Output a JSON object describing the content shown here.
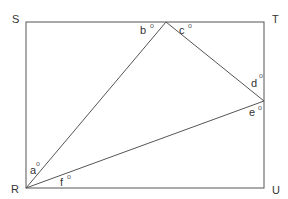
{
  "diagram": {
    "title": "",
    "colors": {
      "line": "#555555",
      "text": "#333333",
      "background": "#ffffff"
    },
    "rectangle": {
      "corners": [
        "S",
        "T",
        "U",
        "R"
      ]
    },
    "vertex_labels": {
      "S": "S",
      "T": "T",
      "U": "U",
      "R": "R"
    },
    "angle_labels": {
      "a": "a",
      "b": "b",
      "c": "c",
      "d": "d",
      "e": "e",
      "f": "f"
    },
    "degree_symbol": "o"
  }
}
